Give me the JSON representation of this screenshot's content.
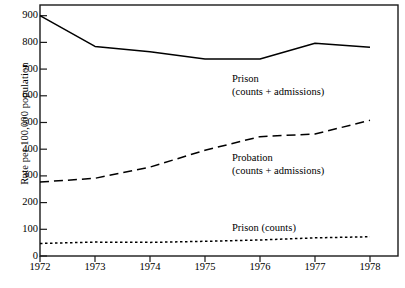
{
  "chart_data": {
    "type": "line",
    "title": "",
    "xlabel": "",
    "ylabel": "Rate per 100,000 population",
    "x": [
      1972,
      1973,
      1974,
      1975,
      1976,
      1977,
      1978
    ],
    "xtick_labels": [
      "1972",
      "1973",
      "1974",
      "1975",
      "1976",
      "1977",
      "1978"
    ],
    "ytick_labels": [
      "0",
      "100",
      "200",
      "300",
      "400",
      "500",
      "600",
      "700",
      "800",
      "900"
    ],
    "ytick_values": [
      0,
      100,
      200,
      300,
      400,
      500,
      600,
      700,
      800,
      900
    ],
    "xlim": [
      1972,
      1978
    ],
    "ylim": [
      0,
      940
    ],
    "grid": false,
    "legend_position": "inline-annotations",
    "series": [
      {
        "name": "Prison (counts + admissions)",
        "style": "solid",
        "color": "#000000",
        "values": [
          900,
          785,
          765,
          738,
          738,
          797,
          782
        ]
      },
      {
        "name": "Probation (counts + admissions)",
        "style": "dashed",
        "color": "#000000",
        "values": [
          277,
          291,
          333,
          396,
          447,
          457,
          508
        ]
      },
      {
        "name": "Prison (counts)",
        "style": "dotted",
        "color": "#000000",
        "values": [
          47,
          52,
          51,
          55,
          60,
          68,
          72
        ]
      }
    ],
    "annotations": [
      {
        "id": "prison-total",
        "line1": "Prison",
        "line2": "(counts + admissions)"
      },
      {
        "id": "probation-total",
        "line1": "Probation",
        "line2": "(counts + admissions)"
      },
      {
        "id": "prison-counts",
        "line1": "Prison (counts)",
        "line2": ""
      }
    ]
  }
}
